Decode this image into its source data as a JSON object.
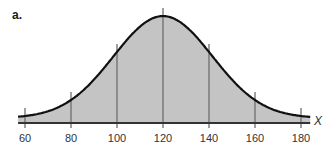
{
  "panel_label": "a.",
  "chart_data": {
    "type": "area",
    "title": "",
    "subtitle": "Normal distribution curve",
    "xlabel": "X",
    "ylabel": "",
    "distribution": {
      "mean": 120,
      "sd": 20
    },
    "x_ticks": [
      60,
      80,
      100,
      120,
      140,
      160,
      180
    ],
    "tick_labels": [
      "60",
      "80",
      "100",
      "120",
      "140",
      "160",
      "180"
    ],
    "xlim": [
      57,
      184
    ],
    "vertical_lines_at": [
      60,
      80,
      100,
      120,
      140,
      160,
      180
    ],
    "grid": false,
    "legend": null,
    "fill_color": "#c4c4c4",
    "curve_color": "#111111",
    "line_color": "#6e6e6e",
    "axis_color": "#333333"
  }
}
